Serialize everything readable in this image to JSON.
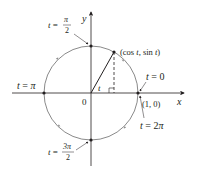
{
  "diagram": {
    "type": "unit-circle-parametrization",
    "axes": {
      "x_label": "x",
      "y_label": "y",
      "origin_label": "0"
    },
    "point_label": "(cos t, sin t)",
    "point_label_parts": {
      "open": "(cos ",
      "t1": "t",
      "mid": ", sin ",
      "t2": "t",
      "close": ")"
    },
    "angle_label": "t",
    "unit_point_label": "(1, 0)",
    "markers": [
      {
        "id": "t0",
        "text_t": "t",
        "text_eq": " = 0"
      },
      {
        "id": "t2pi",
        "text_t": "t",
        "text_eq": " = 2",
        "text_pi": "π"
      },
      {
        "id": "tpi",
        "text_t": "t",
        "text_eq": " = ",
        "text_pi": "π"
      },
      {
        "id": "tpi2",
        "text_t": "t",
        "text_eq": " = ",
        "num": "π",
        "den": "2"
      },
      {
        "id": "t3pi2",
        "text_t": "t",
        "text_eq": " = ",
        "num": "3π",
        "den": "2"
      }
    ],
    "colors": {
      "circle": "#8a8a8a",
      "ink": "#231f20",
      "point": "#231f20"
    }
  }
}
